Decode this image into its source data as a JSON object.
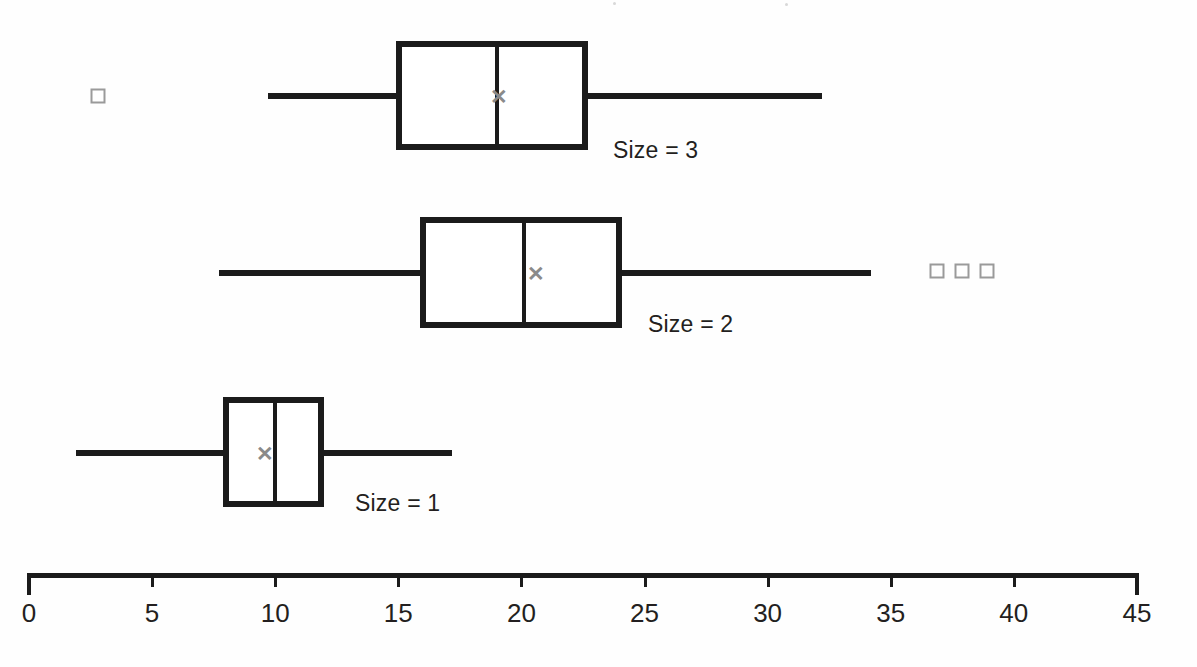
{
  "chart_data": {
    "type": "box",
    "title": "",
    "xlabel": "",
    "ylabel": "",
    "orientation": "horizontal",
    "xlim": [
      0,
      45
    ],
    "grid": false,
    "legend": "none",
    "tick_labels": [
      "0",
      "5",
      "10",
      "15",
      "20",
      "25",
      "30",
      "35",
      "40",
      "45"
    ],
    "tick_values": [
      0,
      5,
      10,
      15,
      20,
      25,
      30,
      35,
      40,
      45
    ],
    "tick_step": 5,
    "mean_marker_symbol": "✕",
    "series": [
      {
        "name": "Size = 3",
        "label": "Size = 3",
        "whisker_low": 9.7,
        "q1": 14.9,
        "median": 19.0,
        "q3": 22.7,
        "whisker_high": 32.2,
        "mean": 19.1,
        "outliers": [
          2.8
        ]
      },
      {
        "name": "Size = 2",
        "label": "Size = 2",
        "whisker_low": 7.7,
        "q1": 15.9,
        "median": 20.1,
        "q3": 24.1,
        "whisker_high": 34.2,
        "mean": 20.6,
        "outliers": [
          36.9,
          37.9,
          38.9
        ]
      },
      {
        "name": "Size = 1",
        "label": "Size = 1",
        "whisker_low": 1.9,
        "q1": 7.9,
        "median": 10.0,
        "q3": 12.0,
        "whisker_high": 17.2,
        "mean": 9.6,
        "outliers": []
      }
    ],
    "colors": {
      "line": "#1b1b1b",
      "box_fill": "#ffffff",
      "mean_marker": "#8a8a8a",
      "outlier": "#9a9a9a",
      "text": "#231f20",
      "background": "#ffffff"
    }
  },
  "layout": {
    "axis": {
      "x_origin_px": 29,
      "x_end_px": 1137,
      "px_per_unit": 24.62,
      "line_y_px": 573,
      "tick_len_px": 14,
      "endcap_len_px": 22,
      "label_y_px": 598
    },
    "rows": [
      {
        "center_y_px": 96,
        "box_top_px": 41,
        "box_bottom_px": 150,
        "label_x_px": 613,
        "label_y_px": 137,
        "outlier_y_px": 96
      },
      {
        "center_y_px": 273,
        "box_top_px": 217,
        "box_bottom_px": 328,
        "label_x_px": 648,
        "label_y_px": 311,
        "outlier_y_px": 271
      },
      {
        "center_y_px": 453,
        "box_top_px": 397,
        "box_bottom_px": 507,
        "label_x_px": 355,
        "label_y_px": 490,
        "outlier_y_px": 453
      }
    ]
  }
}
